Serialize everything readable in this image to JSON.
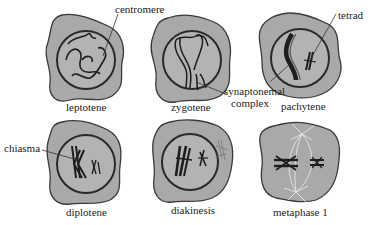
{
  "colors": {
    "cytoplasm": "#a9a9a9",
    "outline": "#3a3a3a",
    "nucleus_fill": "#b3b3b3",
    "chromosome": "#1e1e1e",
    "text": "#222222"
  },
  "stages": [
    {
      "name": "leptotene",
      "annotations": [
        "centromere"
      ]
    },
    {
      "name": "zygotene",
      "annotations": [
        "synaptonemal complex"
      ]
    },
    {
      "name": "pachytene",
      "annotations": [
        "tetrad"
      ]
    },
    {
      "name": "diplotene",
      "annotations": [
        "chiasma"
      ]
    },
    {
      "name": "diakinesis",
      "annotations": []
    },
    {
      "name": "metaphase 1",
      "annotations": []
    }
  ],
  "labels": {
    "centromere": "centromere",
    "synaptonemal_line1": "synaptonemal",
    "synaptonemal_line2": "complex",
    "tetrad": "tetrad",
    "chiasma": "chiasma"
  }
}
